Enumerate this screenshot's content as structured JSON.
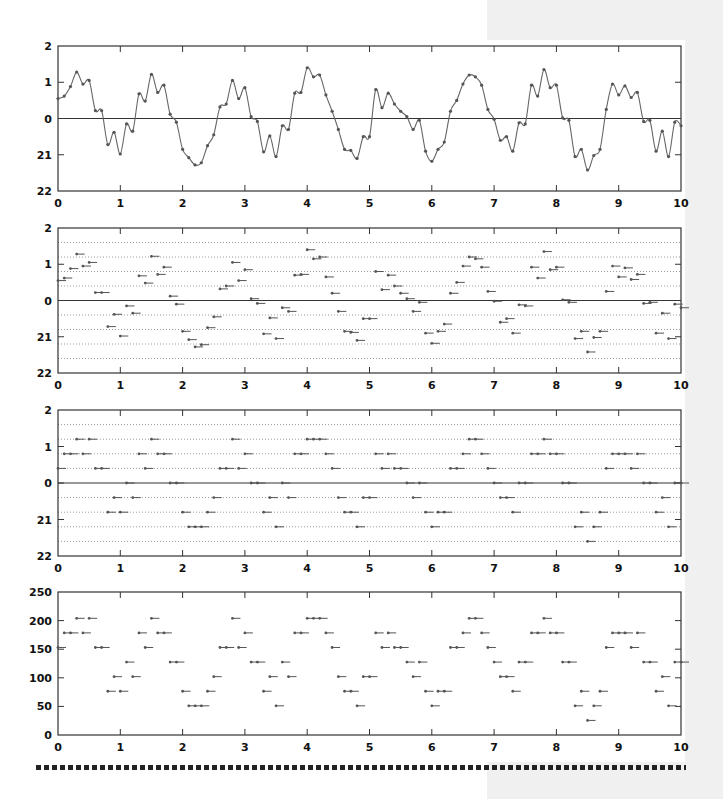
{
  "background": {
    "color": "#ffffff",
    "side_panel_color": "#f0f0f0"
  },
  "colors": {
    "axis": "#333333",
    "curve": "#666666",
    "marker": "#555555",
    "grid_dotted": "#9a9a9a",
    "zero_line": "#333333"
  },
  "chart_data": [
    {
      "type": "line",
      "title": "",
      "description": "Continuous analog signal with sample points",
      "xlabel": "",
      "ylabel": "",
      "xlim": [
        0,
        10
      ],
      "ylim": [
        -2,
        2
      ],
      "xticks": [
        "0",
        "1",
        "2",
        "3",
        "4",
        "5",
        "6",
        "7",
        "8",
        "9",
        "10"
      ],
      "yticks": [
        "2",
        "1",
        "0",
        "21",
        "22"
      ],
      "ytick_values": [
        2,
        1,
        0,
        -1,
        -2
      ],
      "grid": false,
      "zero_line": true,
      "x_step": 0.1,
      "sample_values": [
        0.55,
        0.62,
        0.88,
        1.28,
        0.95,
        1.05,
        0.22,
        0.22,
        -0.72,
        -0.38,
        -0.98,
        -0.15,
        -0.35,
        0.68,
        0.48,
        1.22,
        0.72,
        0.92,
        0.12,
        -0.1,
        -0.85,
        -1.08,
        -1.28,
        -1.22,
        -0.75,
        -0.45,
        0.32,
        0.4,
        1.05,
        0.55,
        0.85,
        0.05,
        -0.08,
        -0.92,
        -0.48,
        -1.05,
        -0.2,
        -0.3,
        0.7,
        0.72,
        1.4,
        1.15,
        1.2,
        0.65,
        0.2,
        -0.3,
        -0.85,
        -0.88,
        -1.1,
        -0.5,
        -0.5,
        0.8,
        0.3,
        0.7,
        0.4,
        0.2,
        0.05,
        -0.3,
        -0.05,
        -0.9,
        -1.18,
        -0.85,
        -0.65,
        0.2,
        0.5,
        0.95,
        1.2,
        1.15,
        0.92,
        0.25,
        -0.02,
        -0.6,
        -0.5,
        -0.9,
        -0.12,
        -0.15,
        0.92,
        0.62,
        1.35,
        0.85,
        0.92,
        0.02,
        -0.05,
        -1.05,
        -0.85,
        -1.42,
        -1.02,
        -0.85,
        0.25,
        0.95,
        0.65,
        0.9,
        0.58,
        0.72,
        -0.08,
        -0.05,
        -0.9,
        -0.35,
        -1.05,
        -0.1,
        -0.2
      ]
    },
    {
      "type": "scatter",
      "title": "",
      "description": "Sampled values (sample-and-hold markers)",
      "xlim": [
        0,
        10
      ],
      "ylim": [
        -2,
        2
      ],
      "xticks": [
        "0",
        "1",
        "2",
        "3",
        "4",
        "5",
        "6",
        "7",
        "8",
        "9",
        "10"
      ],
      "yticks": [
        "2",
        "1",
        "0",
        "21",
        "22"
      ],
      "ytick_values": [
        2,
        1,
        0,
        -1,
        -2
      ],
      "grid_lines_dotted": [
        1.6,
        1.2,
        0.8,
        0.4,
        -0.4,
        -0.8,
        -1.2,
        -1.6
      ],
      "zero_line": true,
      "source": "sample_values of chart 1"
    },
    {
      "type": "scatter",
      "title": "",
      "description": "Quantized samples (step 0.4)",
      "xlim": [
        0,
        10
      ],
      "ylim": [
        -2,
        2
      ],
      "xticks": [
        "0",
        "1",
        "2",
        "3",
        "4",
        "5",
        "6",
        "7",
        "8",
        "9",
        "10"
      ],
      "yticks": [
        "2",
        "1",
        "0",
        "21",
        "22"
      ],
      "ytick_values": [
        2,
        1,
        0,
        -1,
        -2
      ],
      "grid_lines_dotted": [
        1.6,
        1.2,
        0.8,
        0.4,
        -0.4,
        -0.8,
        -1.2,
        -1.6
      ],
      "zero_line": true,
      "quant_step": 0.4,
      "quant_min": -1.6,
      "quant_max": 1.2,
      "source": "sample_values of chart 1 quantized"
    },
    {
      "type": "scatter",
      "title": "",
      "description": "Digital codes (0-255)",
      "xlim": [
        0,
        10
      ],
      "ylim": [
        0,
        250
      ],
      "xticks": [
        "0",
        "1",
        "2",
        "3",
        "4",
        "5",
        "6",
        "7",
        "8",
        "9",
        "10"
      ],
      "yticks": [
        "250",
        "200",
        "150",
        "100",
        "50",
        "0"
      ],
      "ytick_values": [
        250,
        200,
        150,
        100,
        50,
        0
      ],
      "zero_line": false,
      "code_levels": [
        25.5,
        51,
        76.5,
        102,
        127.5,
        153,
        178.5,
        204
      ],
      "source": "quantized values mapped: code = (q + 2) / 4 * 255"
    }
  ],
  "plots": [
    {
      "top": 46,
      "bottom": 191
    },
    {
      "top": 228,
      "bottom": 373
    },
    {
      "top": 410,
      "bottom": 556
    },
    {
      "top": 592,
      "bottom": 735
    }
  ],
  "plot_x": {
    "left": 58,
    "right": 681
  }
}
